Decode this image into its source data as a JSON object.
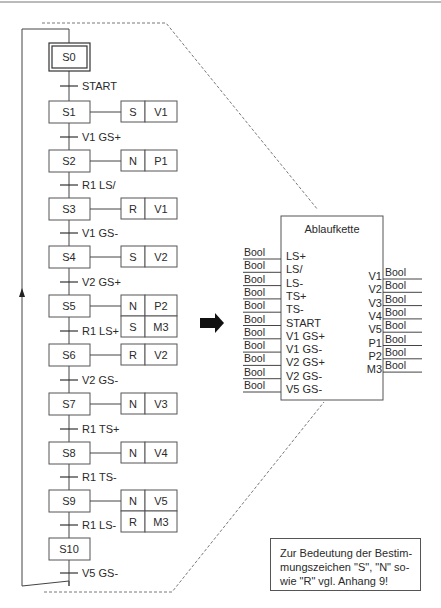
{
  "diagram": {
    "type": "sequential-function-chart",
    "initial_step": "S0",
    "steps": [
      {
        "name": "S0",
        "initial": true,
        "actions": []
      },
      {
        "name": "S1",
        "actions": [
          {
            "qualifier": "S",
            "variable": "V1"
          }
        ]
      },
      {
        "name": "S2",
        "actions": [
          {
            "qualifier": "N",
            "variable": "P1"
          }
        ]
      },
      {
        "name": "S3",
        "actions": [
          {
            "qualifier": "R",
            "variable": "V1"
          }
        ]
      },
      {
        "name": "S4",
        "actions": [
          {
            "qualifier": "S",
            "variable": "V2"
          }
        ]
      },
      {
        "name": "S5",
        "actions": [
          {
            "qualifier": "N",
            "variable": "P2"
          },
          {
            "qualifier": "S",
            "variable": "M3"
          }
        ]
      },
      {
        "name": "S6",
        "actions": [
          {
            "qualifier": "R",
            "variable": "V2"
          }
        ]
      },
      {
        "name": "S7",
        "actions": [
          {
            "qualifier": "N",
            "variable": "V3"
          }
        ]
      },
      {
        "name": "S8",
        "actions": [
          {
            "qualifier": "N",
            "variable": "V4"
          }
        ]
      },
      {
        "name": "S9",
        "actions": [
          {
            "qualifier": "N",
            "variable": "V5"
          },
          {
            "qualifier": "R",
            "variable": "M3"
          }
        ]
      },
      {
        "name": "S10",
        "actions": []
      }
    ],
    "transitions": [
      "START",
      "V1 GS+",
      "R1 LS/",
      "V1 GS-",
      "V2 GS+",
      "R1 LS+",
      "V2 GS-",
      "R1 TS+",
      "R1 TS-",
      "R1 LS-",
      "V5 GS-"
    ]
  },
  "function_block": {
    "title": "Ablaufkette",
    "inputs": [
      {
        "name": "LS+",
        "type": "Bool"
      },
      {
        "name": "LS/",
        "type": "Bool"
      },
      {
        "name": "LS-",
        "type": "Bool"
      },
      {
        "name": "TS+",
        "type": "Bool"
      },
      {
        "name": "TS-",
        "type": "Bool"
      },
      {
        "name": "START",
        "type": "Bool"
      },
      {
        "name": "V1 GS+",
        "type": "Bool"
      },
      {
        "name": "V1 GS-",
        "type": "Bool"
      },
      {
        "name": "V2 GS+",
        "type": "Bool"
      },
      {
        "name": "V2 GS-",
        "type": "Bool"
      },
      {
        "name": "V5 GS-",
        "type": "Bool"
      }
    ],
    "outputs": [
      {
        "name": "V1",
        "type": "Bool"
      },
      {
        "name": "V2",
        "type": "Bool"
      },
      {
        "name": "V3",
        "type": "Bool"
      },
      {
        "name": "V4",
        "type": "Bool"
      },
      {
        "name": "V5",
        "type": "Bool"
      },
      {
        "name": "P1",
        "type": "Bool"
      },
      {
        "name": "P2",
        "type": "Bool"
      },
      {
        "name": "M3",
        "type": "Bool"
      }
    ]
  },
  "arrow": {
    "icon": "right-arrow-icon",
    "glyph": "➡"
  },
  "note": {
    "lines": [
      "Zur Bedeutung der Bestim-",
      "mungszeichen \"S\", \"N\" so-",
      "wie \"R\" vgl. Anhang 9!"
    ]
  },
  "colors": {
    "line": "#444444",
    "text": "#2a2a2a",
    "dash": "#555555",
    "arrow": "#111111"
  }
}
